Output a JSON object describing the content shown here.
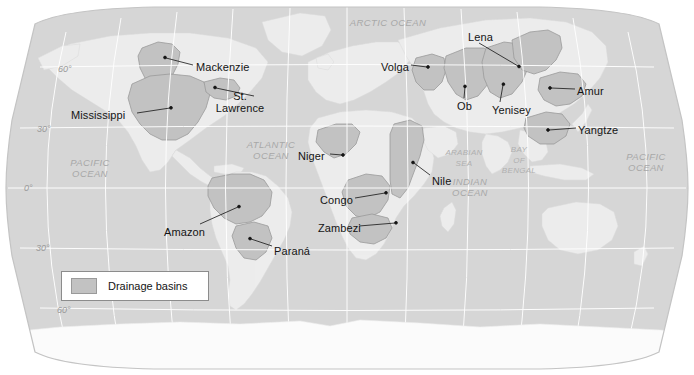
{
  "map": {
    "title": "World drainage basins map",
    "projection": "robinson",
    "colors": {
      "ocean": "#d6d6d6",
      "land": "#ededed",
      "basin_fill": "#c2c2c2",
      "basin_stroke": "#9a9a9a",
      "graticule": "#ffffff",
      "frame": "#b8b8b8",
      "label_text": "#141414",
      "ocean_text": "#a8a8a8",
      "lat_text": "#9a9a9a",
      "page_background": "#ffffff",
      "antarctica": "#fbfbfb"
    }
  },
  "legend": {
    "label": "Drainage basins",
    "swatch_color": "#c2c2c2"
  },
  "river_labels": [
    {
      "name": "Mackenzie",
      "text": "Mackenzie",
      "x": 196,
      "y": 62,
      "align": "left",
      "lines": [
        "Mackenzie"
      ]
    },
    {
      "name": "St-Lawrence",
      "text": "St. Lawrence",
      "x": 240,
      "y": 91,
      "align": "center",
      "lines": [
        "St.",
        "Lawrence"
      ]
    },
    {
      "name": "Mississippi",
      "text": "Mississippi",
      "x": 71,
      "y": 110,
      "align": "left",
      "lines": [
        "Mississippi"
      ]
    },
    {
      "name": "Niger",
      "text": "Niger",
      "x": 298,
      "y": 151,
      "align": "left",
      "lines": [
        "Niger"
      ]
    },
    {
      "name": "Congo",
      "text": "Congo",
      "x": 320,
      "y": 195,
      "align": "left",
      "lines": [
        "Congo"
      ]
    },
    {
      "name": "Zambezi",
      "text": "Zambezi",
      "x": 318,
      "y": 223,
      "align": "left",
      "lines": [
        "Zambezi"
      ]
    },
    {
      "name": "Nile",
      "text": "Nile",
      "x": 432,
      "y": 176,
      "align": "left",
      "lines": [
        "Nile"
      ]
    },
    {
      "name": "Amazon",
      "text": "Amazon",
      "x": 164,
      "y": 227,
      "align": "left",
      "lines": [
        "Amazon"
      ]
    },
    {
      "name": "Parana",
      "text": "Paraná",
      "x": 274,
      "y": 246,
      "align": "left",
      "lines": [
        "Paraná"
      ]
    },
    {
      "name": "Volga",
      "text": "Volga",
      "x": 381,
      "y": 62,
      "align": "left",
      "lines": [
        "Volga"
      ]
    },
    {
      "name": "Lena",
      "text": "Lena",
      "x": 468,
      "y": 32,
      "align": "left",
      "lines": [
        "Lena"
      ]
    },
    {
      "name": "Ob",
      "text": "Ob",
      "x": 457,
      "y": 101,
      "align": "left",
      "lines": [
        "Ob"
      ]
    },
    {
      "name": "Yenisey",
      "text": "Yenisey",
      "x": 492,
      "y": 105,
      "align": "left",
      "lines": [
        "Yenisey"
      ]
    },
    {
      "name": "Amur",
      "text": "Amur",
      "x": 577,
      "y": 86,
      "align": "left",
      "lines": [
        "Amur"
      ]
    },
    {
      "name": "Yangtze",
      "text": "Yangtze",
      "x": 578,
      "y": 125,
      "align": "left",
      "lines": [
        "Yangtze"
      ]
    }
  ],
  "ocean_labels": [
    {
      "name": "arctic-ocean",
      "x": 388,
      "y": 18,
      "size": "big",
      "lines": [
        "ARCTIC OCEAN"
      ]
    },
    {
      "name": "atlantic-ocean",
      "x": 271,
      "y": 140,
      "size": "big",
      "lines": [
        "ATLANTIC",
        "OCEAN"
      ]
    },
    {
      "name": "pacific-ocean-west",
      "x": 90,
      "y": 158,
      "size": "big",
      "lines": [
        "PACIFIC",
        "OCEAN"
      ]
    },
    {
      "name": "pacific-ocean-east",
      "x": 646,
      "y": 152,
      "size": "big",
      "lines": [
        "PACIFIC",
        "OCEAN"
      ]
    },
    {
      "name": "indian-ocean",
      "x": 470,
      "y": 177,
      "size": "big",
      "lines": [
        "INDIAN",
        "OCEAN"
      ]
    },
    {
      "name": "arabian-sea",
      "x": 464,
      "y": 148,
      "size": "sea",
      "lines": [
        "ARABIAN",
        "SEA"
      ]
    },
    {
      "name": "bay-of-bengal",
      "x": 519,
      "y": 145,
      "size": "sea",
      "lines": [
        "BAY",
        "OF",
        "BENGAL"
      ]
    }
  ],
  "latitude_labels": [
    {
      "name": "lat-60-north",
      "text": "60°",
      "x": 58,
      "y": 64
    },
    {
      "name": "lat-30-north",
      "text": "30°",
      "x": 37,
      "y": 124
    },
    {
      "name": "lat-0",
      "text": "0°",
      "x": 24,
      "y": 183
    },
    {
      "name": "lat-30-south",
      "text": "30°",
      "x": 36,
      "y": 243
    },
    {
      "name": "lat-60-south",
      "text": "60°",
      "x": 57,
      "y": 305
    }
  ]
}
